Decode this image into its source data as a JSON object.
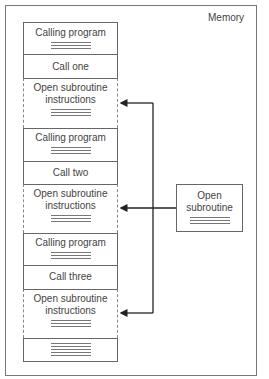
{
  "diagram": {
    "frame_label": "Memory",
    "cells": [
      {
        "label": "Calling program",
        "type": "calling",
        "lines": 3
      },
      {
        "label": "Call one",
        "type": "call",
        "lines": 0
      },
      {
        "label": "Open subroutine instructions",
        "type": "open",
        "lines": 3
      },
      {
        "label": "Calling program",
        "type": "calling",
        "lines": 3
      },
      {
        "label": "Call two",
        "type": "call",
        "lines": 0
      },
      {
        "label": "Open subroutine instructions",
        "type": "open",
        "lines": 3
      },
      {
        "label": "Calling program",
        "type": "calling",
        "lines": 3
      },
      {
        "label": "Call three",
        "type": "call",
        "lines": 0
      },
      {
        "label": "Open subroutine instructions",
        "type": "open",
        "lines": 3
      },
      {
        "label": "",
        "type": "end",
        "lines": 6
      }
    ],
    "subroutine_box": {
      "label_line1": "Open",
      "label_line2": "subroutine",
      "lines": 3
    },
    "arrows": [
      "subroutine-to-open-1",
      "subroutine-to-open-2",
      "subroutine-to-open-3"
    ]
  }
}
